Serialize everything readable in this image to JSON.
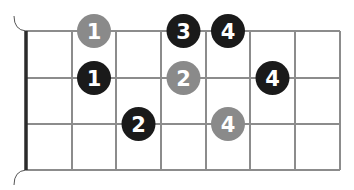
{
  "diagram": {
    "type": "fretboard-fingering",
    "strings": 4,
    "frets_shown": 7,
    "colors": {
      "root_note": "#8a8a8a",
      "scale_note": "#1a1a1a",
      "grid_line": "#8c8c8c",
      "nut": "#2b2b2b",
      "label": "#ffffff"
    },
    "notes": [
      {
        "string_row": 0,
        "fret": 2,
        "finger": "1",
        "kind": "root"
      },
      {
        "string_row": 0,
        "fret": 4,
        "finger": "3",
        "kind": "scale"
      },
      {
        "string_row": 0,
        "fret": 5,
        "finger": "4",
        "kind": "scale"
      },
      {
        "string_row": 1,
        "fret": 2,
        "finger": "1",
        "kind": "scale"
      },
      {
        "string_row": 1,
        "fret": 4,
        "finger": "2",
        "kind": "root"
      },
      {
        "string_row": 1,
        "fret": 6,
        "finger": "4",
        "kind": "scale"
      },
      {
        "string_row": 2,
        "fret": 3,
        "finger": "2",
        "kind": "scale"
      },
      {
        "string_row": 2,
        "fret": 5,
        "finger": "4",
        "kind": "root"
      }
    ]
  }
}
